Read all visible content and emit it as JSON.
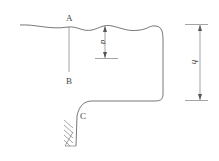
{
  "diagram": {
    "type": "hydraulic-cross-section",
    "points": {
      "A": "A",
      "B": "B",
      "C": "C"
    },
    "dimensions": {
      "depth_label": "a",
      "height_label": "h"
    },
    "colors": {
      "line": "#555555",
      "text": "#444444",
      "background": "#ffffff"
    }
  }
}
